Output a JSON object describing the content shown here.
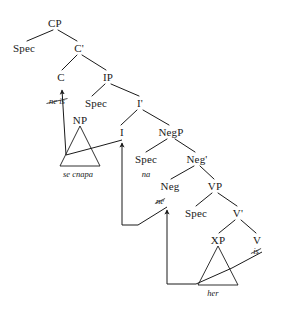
{
  "figure": {
    "kind": "syntactic-tree",
    "ink_color": "#1a1a1a",
    "background_color": "#ffffff"
  },
  "nodes": [
    {
      "id": "CP",
      "label": "CP",
      "x": 55,
      "y": 23
    },
    {
      "id": "SpecCP",
      "label": "Spec",
      "x": 24,
      "y": 48
    },
    {
      "id": "Cbar",
      "label": "C'",
      "x": 79,
      "y": 48
    },
    {
      "id": "C",
      "label": "C",
      "x": 61,
      "y": 77
    },
    {
      "id": "IP",
      "label": "IP",
      "x": 108,
      "y": 77
    },
    {
      "id": "SpecIP",
      "label": "Spec",
      "x": 96,
      "y": 103
    },
    {
      "id": "Ibar",
      "label": "I'",
      "x": 140,
      "y": 103
    },
    {
      "id": "NP",
      "label": "NP",
      "x": 80,
      "y": 120
    },
    {
      "id": "I",
      "label": "I",
      "x": 122,
      "y": 132
    },
    {
      "id": "NegP",
      "label": "NegP",
      "x": 171,
      "y": 132
    },
    {
      "id": "SpecNegP",
      "label": "Spec",
      "x": 146,
      "y": 159
    },
    {
      "id": "Negbar",
      "label": "Neg'",
      "x": 197,
      "y": 159
    },
    {
      "id": "Neg",
      "label": "Neg",
      "x": 170,
      "y": 186
    },
    {
      "id": "VP",
      "label": "VP",
      "x": 215,
      "y": 186
    },
    {
      "id": "SpecVP",
      "label": "Spec",
      "x": 196,
      "y": 213
    },
    {
      "id": "Vbar",
      "label": "V'",
      "x": 238,
      "y": 213
    },
    {
      "id": "XP",
      "label": "XP",
      "x": 218,
      "y": 240
    },
    {
      "id": "V",
      "label": "V",
      "x": 257,
      "y": 240
    }
  ],
  "lexical_items": [
    {
      "id": "ne-is",
      "text": "ne is",
      "x": 57,
      "y": 101,
      "struck": true
    },
    {
      "id": "se-cnapa",
      "text": "se cnapa",
      "x": 78,
      "y": 174,
      "struck": false
    },
    {
      "id": "na",
      "text": "na",
      "x": 146,
      "y": 174,
      "struck": false
    },
    {
      "id": "ne",
      "text": "ne",
      "x": 160,
      "y": 201,
      "struck": true
    },
    {
      "id": "is",
      "text": "is",
      "x": 256,
      "y": 251,
      "struck": true
    },
    {
      "id": "her",
      "text": "her",
      "x": 213,
      "y": 293,
      "struck": false
    }
  ],
  "branches": [
    {
      "from": "CP",
      "to": "SpecCP",
      "x1": 53,
      "y1": 30,
      "x2": 27,
      "y2": 41
    },
    {
      "from": "CP",
      "to": "Cbar",
      "x1": 58,
      "y1": 30,
      "x2": 77,
      "y2": 41
    },
    {
      "from": "Cbar",
      "to": "C",
      "x1": 77,
      "y1": 55,
      "x2": 62,
      "y2": 70
    },
    {
      "from": "Cbar",
      "to": "IP",
      "x1": 82,
      "y1": 55,
      "x2": 106,
      "y2": 70
    },
    {
      "from": "IP",
      "to": "SpecIP",
      "x1": 105,
      "y1": 84,
      "x2": 92,
      "y2": 96
    },
    {
      "from": "IP",
      "to": "Ibar",
      "x1": 111,
      "y1": 84,
      "x2": 139,
      "y2": 96
    },
    {
      "from": "Ibar",
      "to": "I",
      "x1": 137,
      "y1": 110,
      "x2": 121,
      "y2": 125
    },
    {
      "from": "Ibar",
      "to": "NegP",
      "x1": 143,
      "y1": 110,
      "x2": 169,
      "y2": 125
    },
    {
      "from": "NegP",
      "to": "SpecNegP",
      "x1": 167,
      "y1": 139,
      "x2": 146,
      "y2": 152
    },
    {
      "from": "NegP",
      "to": "Negbar",
      "x1": 175,
      "y1": 139,
      "x2": 195,
      "y2": 152
    },
    {
      "from": "Negbar",
      "to": "Neg",
      "x1": 194,
      "y1": 166,
      "x2": 171,
      "y2": 179
    },
    {
      "from": "Negbar",
      "to": "VP",
      "x1": 200,
      "y1": 166,
      "x2": 214,
      "y2": 179
    },
    {
      "from": "VP",
      "to": "SpecVP",
      "x1": 212,
      "y1": 193,
      "x2": 196,
      "y2": 206
    },
    {
      "from": "VP",
      "to": "Vbar",
      "x1": 218,
      "y1": 193,
      "x2": 237,
      "y2": 206
    },
    {
      "from": "Vbar",
      "to": "XP",
      "x1": 235,
      "y1": 220,
      "x2": 219,
      "y2": 233
    },
    {
      "from": "Vbar",
      "to": "V",
      "x1": 241,
      "y1": 220,
      "x2": 256,
      "y2": 233
    }
  ],
  "triangles": [
    {
      "id": "NP-triangle",
      "apex_x": 80,
      "apex_y": 126,
      "left_x": 60,
      "right_x": 100,
      "base_y": 166
    },
    {
      "id": "XP-triangle",
      "apex_x": 218,
      "apex_y": 246,
      "left_x": 198,
      "right_x": 238,
      "base_y": 285
    }
  ],
  "movement_arrows": [
    {
      "id": "V-to-Neg",
      "from": "V",
      "to": "Neg",
      "points": "262,252 232,268 196,284 167,284 167,210",
      "arrowhead_at": {
        "x": 167,
        "y": 207
      }
    },
    {
      "id": "Neg-to-I",
      "from": "Neg",
      "to": "I",
      "points": "167,207 138,225 138,225 122,225 122,143",
      "arrowhead_at": {
        "x": 122,
        "y": 140
      }
    },
    {
      "id": "I-to-C",
      "from": "I",
      "to": "C",
      "points": "122,140 100,146 66,155 62,90",
      "arrowhead_at": {
        "x": 61,
        "y": 86
      }
    }
  ]
}
